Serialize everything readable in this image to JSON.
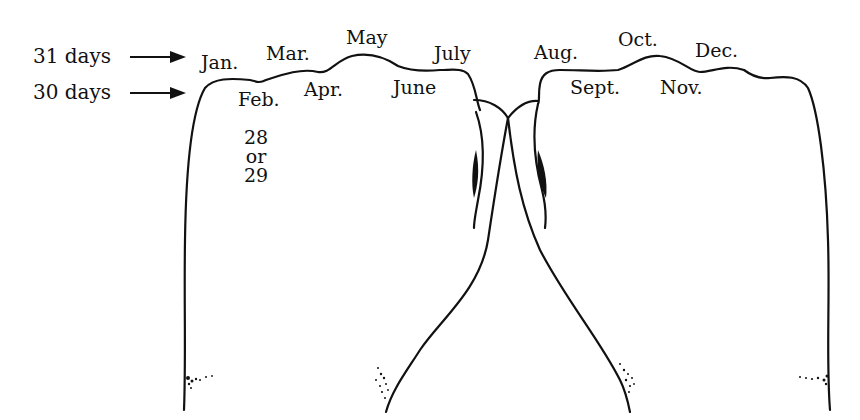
{
  "diagram": {
    "type": "knuckle-mnemonic",
    "legend": {
      "long_months": {
        "label": "31 days",
        "arrow": "right-arrow"
      },
      "short_months": {
        "label": "30 days",
        "arrow": "right-arrow"
      }
    },
    "knuckle_months": [
      {
        "label": "Jan."
      },
      {
        "label": "Mar."
      },
      {
        "label": "May"
      },
      {
        "label": "July"
      },
      {
        "label": "Aug."
      },
      {
        "label": "Oct."
      },
      {
        "label": "Dec."
      }
    ],
    "valley_months": [
      {
        "label": "Feb."
      },
      {
        "label": "Apr."
      },
      {
        "label": "June"
      },
      {
        "label": "Sept."
      },
      {
        "label": "Nov."
      }
    ],
    "february_note": {
      "line1": "28",
      "line2": "or",
      "line3": "29"
    },
    "colors": {
      "ink": "#111111",
      "background": "#ffffff"
    }
  }
}
